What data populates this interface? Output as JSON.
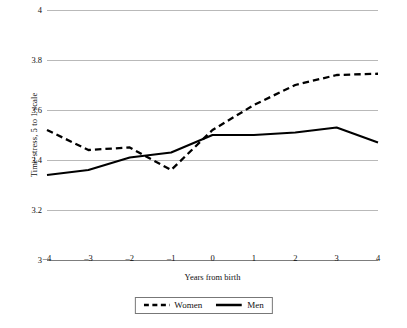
{
  "chart_data": {
    "type": "line",
    "title": "",
    "xlabel": "Years from birth",
    "ylabel": "Time-stress, 5 to 1 scale",
    "x": [
      -4,
      -3,
      -2,
      -1,
      0,
      1,
      2,
      3,
      4
    ],
    "xticklabels": [
      "–4",
      "–3",
      "–2",
      "–1",
      "0",
      "1",
      "2",
      "3",
      "4"
    ],
    "yticks": [
      3,
      3.2,
      3.4,
      3.6,
      3.8,
      4
    ],
    "yticklabels": [
      "3",
      "3.2",
      "3.4",
      "3.6",
      "3.8",
      "4"
    ],
    "xlim": [
      -4,
      4
    ],
    "ylim": [
      3,
      4
    ],
    "grid": true,
    "legend_position": "bottom-center",
    "series": [
      {
        "name": "Women",
        "style": "dashed",
        "color": "#000000",
        "values": [
          3.52,
          3.44,
          3.45,
          3.36,
          3.52,
          3.62,
          3.7,
          3.74,
          3.745
        ]
      },
      {
        "name": "Men",
        "style": "solid",
        "color": "#000000",
        "values": [
          3.34,
          3.36,
          3.41,
          3.43,
          3.5,
          3.5,
          3.51,
          3.53,
          3.47
        ]
      }
    ]
  },
  "legend": {
    "items": [
      {
        "label": "Women",
        "style": "dashed"
      },
      {
        "label": "Men",
        "style": "solid"
      }
    ]
  }
}
